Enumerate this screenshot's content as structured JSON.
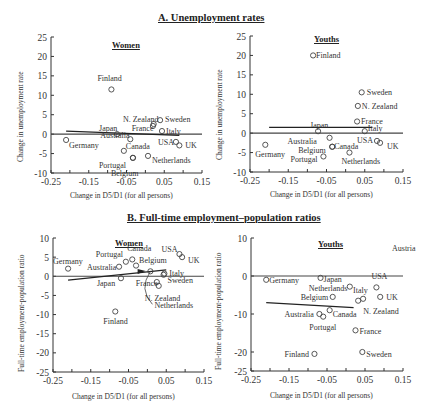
{
  "sections": {
    "A": {
      "title": "A. Unemployment rates"
    },
    "B": {
      "title": "B. Full-time employment–population ratios"
    }
  },
  "chart_data": [
    {
      "id": "A-women",
      "type": "scatter",
      "section": "A. Unemployment rates",
      "title": "Women",
      "xlabel": "Change in D5/D1 (for all persons)",
      "ylabel": "Change in unemployment rate",
      "xlim": [
        -0.25,
        0.15
      ],
      "ylim": [
        -10,
        25
      ],
      "xticks": [
        -0.25,
        -0.15,
        -0.05,
        0.05,
        0.15
      ],
      "yticks": [
        -10,
        -5,
        0,
        5,
        10,
        15,
        20,
        25
      ],
      "points": [
        {
          "label": "Finland",
          "x": -0.09,
          "y": 11.5
        },
        {
          "label": "N. Zealand",
          "x": 0.02,
          "y": 2.1
        },
        {
          "label": "Sweden",
          "x": 0.039,
          "y": 3.6
        },
        {
          "label": "France",
          "x": 0.022,
          "y": 2.6
        },
        {
          "label": "Italy",
          "x": 0.044,
          "y": 0.8
        },
        {
          "label": "Japan",
          "x": -0.075,
          "y": 0.0
        },
        {
          "label": "Germany",
          "x": -0.21,
          "y": -1.5
        },
        {
          "label": "Australia",
          "x": -0.04,
          "y": -1.3
        },
        {
          "label": "Canada",
          "x": -0.057,
          "y": -4.3
        },
        {
          "label": "Portugal",
          "x": -0.033,
          "y": -6.1
        },
        {
          "label": "Belgium",
          "x": -0.033,
          "y": -6.1
        },
        {
          "label": "Netherlands",
          "x": 0.007,
          "y": -5.6
        },
        {
          "label": "USA",
          "x": 0.081,
          "y": -2.0
        },
        {
          "label": "UK",
          "x": 0.09,
          "y": -2.9
        }
      ],
      "fit_line": {
        "x": [
          -0.21,
          0.09
        ],
        "y": [
          0.8,
          -0.3
        ]
      }
    },
    {
      "id": "A-youths",
      "type": "scatter",
      "section": "A. Unemployment rates",
      "title": "Youths",
      "xlabel": "Change in D5/D1 (for all persons)",
      "ylabel": "Change in unemployment rate",
      "xlim": [
        -0.25,
        0.15
      ],
      "ylim": [
        -10,
        25
      ],
      "xticks": [
        -0.25,
        -0.15,
        -0.05,
        0.05,
        0.15
      ],
      "yticks": [
        -10,
        -5,
        0,
        5,
        10,
        15,
        20,
        25
      ],
      "points": [
        {
          "label": "Finland",
          "x": -0.085,
          "y": 20.0
        },
        {
          "label": "Sweden",
          "x": 0.042,
          "y": 10.5
        },
        {
          "label": "N. Zealand",
          "x": 0.032,
          "y": 7.0
        },
        {
          "label": "France",
          "x": 0.03,
          "y": 3.0
        },
        {
          "label": "Japan",
          "x": -0.072,
          "y": 0.5
        },
        {
          "label": "Italy",
          "x": 0.05,
          "y": 0.5
        },
        {
          "label": "Australia",
          "x": -0.042,
          "y": -1.2
        },
        {
          "label": "Canada",
          "x": -0.035,
          "y": -3.5
        },
        {
          "label": "Germany",
          "x": -0.21,
          "y": -3.0
        },
        {
          "label": "Belgium",
          "x": -0.035,
          "y": -3.5
        },
        {
          "label": "Portugal",
          "x": -0.058,
          "y": -6.0
        },
        {
          "label": "Netherlands",
          "x": 0.01,
          "y": -5.0
        },
        {
          "label": "USA",
          "x": 0.082,
          "y": -2.0
        },
        {
          "label": "UK",
          "x": 0.09,
          "y": -2.5
        }
      ],
      "fit_line": {
        "x": [
          -0.2,
          0.07
        ],
        "y": [
          1.5,
          1.5
        ]
      }
    },
    {
      "id": "B-women",
      "type": "scatter",
      "section": "B. Full-time employment–population ratios",
      "title": "Women",
      "xlabel": "Change in D5/D1 (for all persons)",
      "ylabel": "Full-time employment-population ratio",
      "xlim": [
        -0.25,
        0.15
      ],
      "ylim": [
        -25,
        10
      ],
      "xticks": [
        -0.25,
        -0.15,
        -0.05,
        0.05,
        0.15
      ],
      "yticks": [
        -25,
        -20,
        -15,
        -10,
        -5,
        0,
        5,
        10
      ],
      "points": [
        {
          "label": "Germany",
          "x": -0.21,
          "y": 2.0
        },
        {
          "label": "Australia",
          "x": -0.075,
          "y": 2.5
        },
        {
          "label": "Portugal",
          "x": -0.057,
          "y": 3.8
        },
        {
          "label": "Canada",
          "x": -0.04,
          "y": 4.4
        },
        {
          "label": "Belgium",
          "x": -0.03,
          "y": 2.8
        },
        {
          "label": "Netherlands",
          "x": 0.008,
          "y": 1.3
        },
        {
          "label": "Japan",
          "x": -0.07,
          "y": -0.5
        },
        {
          "label": "France",
          "x": 0.025,
          "y": -1.5
        },
        {
          "label": "N. Zealand",
          "x": 0.03,
          "y": -2.5
        },
        {
          "label": "Italy",
          "x": 0.045,
          "y": 0.7
        },
        {
          "label": "Sweden",
          "x": 0.043,
          "y": 0.4
        },
        {
          "label": "USA",
          "x": 0.085,
          "y": 5.8
        },
        {
          "label": "UK",
          "x": 0.092,
          "y": 5.0
        },
        {
          "label": "Finland",
          "x": -0.085,
          "y": -9.2
        }
      ],
      "fit_line": {
        "x": [
          -0.21,
          0.05
        ],
        "y": [
          -1.0,
          1.7
        ]
      }
    },
    {
      "id": "B-youths",
      "type": "scatter",
      "section": "B. Full-time employment–population ratios",
      "title": "Youths",
      "xlabel": "Change in D5/D1 (for all persons)",
      "ylabel": "Full-time employment-population ratio",
      "xlim": [
        -0.25,
        0.15
      ],
      "ylim": [
        -25,
        10
      ],
      "xticks": [
        -0.25,
        -0.15,
        -0.05,
        0.05,
        0.15
      ],
      "yticks": [
        -25,
        -20,
        -10,
        0,
        10
      ],
      "points": [
        {
          "label": "Germany",
          "x": -0.21,
          "y": -1.0
        },
        {
          "label": "Japan",
          "x": -0.067,
          "y": -0.5
        },
        {
          "label": "Netherlands",
          "x": 0.01,
          "y": -2.8
        },
        {
          "label": "USA",
          "x": 0.08,
          "y": -3.0
        },
        {
          "label": "Belgium",
          "x": -0.035,
          "y": -5.5
        },
        {
          "label": "Italy",
          "x": 0.045,
          "y": -6.0
        },
        {
          "label": "UK",
          "x": 0.09,
          "y": -5.5
        },
        {
          "label": "N. Zealand",
          "x": 0.032,
          "y": -6.5
        },
        {
          "label": "Australia",
          "x": -0.07,
          "y": -10.0
        },
        {
          "label": "Canada",
          "x": -0.043,
          "y": -9.0
        },
        {
          "label": "Portugal",
          "x": -0.06,
          "y": -10.7
        },
        {
          "label": "France",
          "x": 0.025,
          "y": -14.3
        },
        {
          "label": "Finland",
          "x": -0.083,
          "y": -20.5
        },
        {
          "label": "Sweden",
          "x": 0.043,
          "y": -20.0
        },
        {
          "label": "Austria",
          "x": 0.17,
          "y": 6.0
        }
      ],
      "fit_line": {
        "x": [
          -0.21,
          0.02
        ],
        "y": [
          -7.0,
          -8.3
        ]
      }
    }
  ]
}
